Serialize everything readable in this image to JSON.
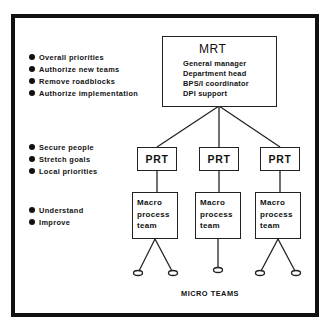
{
  "diagram": {
    "left_bullets": {
      "mrt_responsibilities": [
        "Overall priorities",
        "Authorize new teams",
        "Remove roadblocks",
        "Authorize implementation"
      ],
      "prt_responsibilities": [
        "Secure people",
        "Stretch goals",
        "Local priorities"
      ],
      "macro_team_responsibilities": [
        "Understand",
        "Improve"
      ]
    },
    "mrt": {
      "title": "MRT",
      "members": [
        "General manager",
        "Department head",
        "BPS/I coordinator",
        "DPI support"
      ]
    },
    "prt_boxes": [
      {
        "label": "PRT"
      },
      {
        "label": "PRT"
      },
      {
        "label": "PRT"
      }
    ],
    "macro_boxes": [
      {
        "lines": [
          "Macro",
          "process",
          "team"
        ]
      },
      {
        "lines": [
          "Macro",
          "process",
          "team"
        ]
      },
      {
        "lines": [
          "Macro",
          "process",
          "team"
        ]
      }
    ],
    "micro_teams": {
      "label": "MICRO TEAMS",
      "counts_per_macro": [
        2,
        1,
        2
      ]
    },
    "colors": {
      "ink": "#111111",
      "background": "#ffffff"
    }
  }
}
